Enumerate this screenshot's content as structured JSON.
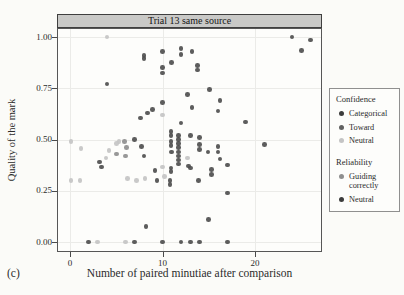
{
  "figure_label": "(c)",
  "colors": {
    "title_strip_bg": "#c9c9c7",
    "panel_border": "#565656",
    "grid": "#ebebe8",
    "page_bg": "#fbfbf8"
  },
  "legend": {
    "sections": [
      {
        "title": "Confidence",
        "items": [
          {
            "label": "Categorical",
            "color": "#3c3c3c"
          },
          {
            "label": "Toward",
            "color": "#616161"
          },
          {
            "label": "Neutral",
            "color": "#c4c4c4"
          }
        ]
      },
      {
        "title": "Reliability",
        "items": [
          {
            "label": "Guiding correctly",
            "color": "#8f8f8f"
          },
          {
            "label": "Neutral",
            "color": "#3c3c3c"
          }
        ]
      }
    ]
  },
  "chart_data": {
    "type": "scatter",
    "title": "Trial 13 same source",
    "xlabel": "Number of paired minutiae after comparison",
    "ylabel": "Quality of the mark",
    "xlim": [
      -1.4,
      27.3
    ],
    "ylim": [
      -0.035,
      1.035
    ],
    "xticks": [
      {
        "label": "0",
        "value": 0
      },
      {
        "label": "10",
        "value": 10
      },
      {
        "label": "20",
        "value": 20
      }
    ],
    "yticks": [
      {
        "label": "0.00",
        "value": 0
      },
      {
        "label": "0.25",
        "value": 0.25
      },
      {
        "label": "0.50",
        "value": 0.5
      },
      {
        "label": "0.75",
        "value": 0.75
      },
      {
        "label": "1.00",
        "value": 1
      }
    ],
    "grid": "major-light",
    "legend_position": "right",
    "shade_colors": {
      "d": "#4f4f4f",
      "m": "#8f8f8f",
      "l": "#c4c4c4"
    },
    "point_format": [
      "x",
      "y",
      "shade"
    ],
    "points": [
      [
        4,
        1.0,
        "l"
      ],
      [
        24,
        1.0,
        "d"
      ],
      [
        26,
        0.985,
        "d"
      ],
      [
        25,
        0.935,
        "d"
      ],
      [
        10,
        0.93,
        "d"
      ],
      [
        12,
        0.945,
        "d"
      ],
      [
        12,
        0.915,
        "d"
      ],
      [
        13.2,
        0.93,
        "d"
      ],
      [
        8,
        0.91,
        "d"
      ],
      [
        8,
        0.895,
        "d"
      ],
      [
        11,
        0.875,
        "d"
      ],
      [
        13.8,
        0.86,
        "d"
      ],
      [
        13.8,
        0.84,
        "d"
      ],
      [
        10,
        0.85,
        "d"
      ],
      [
        10,
        0.825,
        "d"
      ],
      [
        4,
        0.77,
        "d"
      ],
      [
        15.1,
        0.745,
        "d"
      ],
      [
        12.7,
        0.72,
        "d"
      ],
      [
        16.2,
        0.69,
        "d"
      ],
      [
        10,
        0.68,
        "d"
      ],
      [
        13.2,
        0.655,
        "d"
      ],
      [
        8.9,
        0.645,
        "d"
      ],
      [
        16,
        0.64,
        "d"
      ],
      [
        8.4,
        0.63,
        "d"
      ],
      [
        10,
        0.62,
        "l"
      ],
      [
        7.6,
        0.605,
        "d"
      ],
      [
        12,
        0.58,
        "d"
      ],
      [
        19,
        0.585,
        "d"
      ],
      [
        10.9,
        0.54,
        "d"
      ],
      [
        13,
        0.52,
        "d"
      ],
      [
        10.9,
        0.52,
        "d"
      ],
      [
        11.7,
        0.52,
        "d"
      ],
      [
        0.1,
        0.49,
        "l"
      ],
      [
        5.3,
        0.49,
        "l"
      ],
      [
        5.9,
        0.49,
        "m"
      ],
      [
        7,
        0.5,
        "d"
      ],
      [
        14,
        0.51,
        "d"
      ],
      [
        11.7,
        0.5,
        "d"
      ],
      [
        10.9,
        0.49,
        "d"
      ],
      [
        11.7,
        0.48,
        "d"
      ],
      [
        5,
        0.48,
        "l"
      ],
      [
        21,
        0.475,
        "d"
      ],
      [
        14,
        0.475,
        "d"
      ],
      [
        10.9,
        0.47,
        "d"
      ],
      [
        7.7,
        0.465,
        "d"
      ],
      [
        16,
        0.465,
        "d"
      ],
      [
        11.7,
        0.46,
        "d"
      ],
      [
        6.1,
        0.46,
        "m"
      ],
      [
        1.2,
        0.455,
        "l"
      ],
      [
        4.2,
        0.445,
        "l"
      ],
      [
        14,
        0.45,
        "d"
      ],
      [
        11,
        0.44,
        "d"
      ],
      [
        11.7,
        0.44,
        "d"
      ],
      [
        14.9,
        0.44,
        "d"
      ],
      [
        16,
        0.44,
        "d"
      ],
      [
        5,
        0.43,
        "m"
      ],
      [
        6,
        0.42,
        "m"
      ],
      [
        8,
        0.42,
        "d"
      ],
      [
        11.7,
        0.42,
        "d"
      ],
      [
        3.9,
        0.41,
        "l"
      ],
      [
        12.7,
        0.41,
        "l"
      ],
      [
        16.2,
        0.405,
        "d"
      ],
      [
        11.7,
        0.4,
        "d"
      ],
      [
        3.2,
        0.39,
        "d"
      ],
      [
        11.7,
        0.38,
        "d"
      ],
      [
        17,
        0.375,
        "d"
      ],
      [
        12.8,
        0.37,
        "d"
      ],
      [
        3.4,
        0.365,
        "d"
      ],
      [
        10,
        0.365,
        "l"
      ],
      [
        10.9,
        0.36,
        "d"
      ],
      [
        13,
        0.36,
        "d"
      ],
      [
        15.3,
        0.355,
        "d"
      ],
      [
        9.2,
        0.35,
        "d"
      ],
      [
        10.9,
        0.345,
        "d"
      ],
      [
        15.3,
        0.33,
        "d"
      ],
      [
        10.2,
        0.32,
        "l"
      ],
      [
        6.2,
        0.31,
        "l"
      ],
      [
        8.1,
        0.31,
        "l"
      ],
      [
        0.1,
        0.3,
        "l"
      ],
      [
        1.1,
        0.3,
        "l"
      ],
      [
        7.2,
        0.3,
        "l"
      ],
      [
        9.4,
        0.3,
        "d"
      ],
      [
        10.8,
        0.3,
        "d"
      ],
      [
        13.9,
        0.3,
        "d"
      ],
      [
        10.8,
        0.28,
        "d"
      ],
      [
        17,
        0.24,
        "d"
      ],
      [
        15,
        0.11,
        "d"
      ],
      [
        8.2,
        0.075,
        "d"
      ],
      [
        2,
        0,
        "d"
      ],
      [
        3,
        0,
        "l"
      ],
      [
        6,
        0,
        "l"
      ],
      [
        7,
        0,
        "d"
      ],
      [
        10,
        0,
        "d"
      ],
      [
        12,
        0,
        "d"
      ],
      [
        13,
        0,
        "d"
      ],
      [
        14,
        0,
        "d"
      ],
      [
        17,
        0,
        "d"
      ]
    ]
  }
}
